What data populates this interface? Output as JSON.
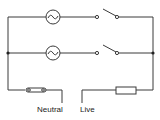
{
  "diagram": {
    "type": "parallel lighting circuit",
    "branches": [
      {
        "lamp": "lamp-1",
        "switch": "switch-1 (open)"
      },
      {
        "lamp": "lamp-2",
        "switch": "switch-2 (open)"
      }
    ],
    "components": {
      "neutral_fuse": "cartridge fuse",
      "live_fuse": "fuse"
    },
    "labels": {
      "neutral": "Neutral",
      "live": "Live"
    },
    "colors": {
      "line": "#3a3a3a",
      "background": "#ffffff"
    }
  }
}
